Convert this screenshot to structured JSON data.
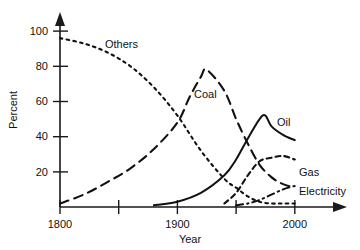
{
  "chart_data": {
    "type": "line",
    "title": "",
    "xlabel": "Year",
    "ylabel": "Percent",
    "xlim": [
      1800,
      2010
    ],
    "ylim": [
      0,
      105
    ],
    "grid": false,
    "legend_position": "inline-labels",
    "x_ticks": [
      {
        "value": 1800,
        "label": "1800"
      },
      {
        "value": 1850,
        "label": ""
      },
      {
        "value": 1900,
        "label": "1900"
      },
      {
        "value": 1950,
        "label": ""
      },
      {
        "value": 2000,
        "label": "2000"
      }
    ],
    "y_ticks": [
      {
        "value": 20,
        "label": "20"
      },
      {
        "value": 40,
        "label": "40"
      },
      {
        "value": 60,
        "label": "60"
      },
      {
        "value": 80,
        "label": "80"
      },
      {
        "value": 100,
        "label": "100"
      }
    ],
    "series": [
      {
        "name": "Others",
        "label": "Others",
        "style": "dotted",
        "x": [
          1800,
          1820,
          1840,
          1860,
          1880,
          1900,
          1920,
          1940,
          1950,
          1960,
          1970,
          1980,
          1990,
          2000
        ],
        "values": [
          96,
          93,
          88,
          80,
          68,
          52,
          32,
          16,
          11,
          6,
          3,
          2,
          2,
          2
        ]
      },
      {
        "name": "Coal",
        "label": "Coal",
        "style": "long-dash",
        "x": [
          1800,
          1820,
          1840,
          1860,
          1880,
          1900,
          1910,
          1920,
          1925,
          1940,
          1950,
          1960,
          1970,
          1980,
          1990,
          2000
        ],
        "values": [
          2,
          7,
          14,
          22,
          33,
          48,
          62,
          74,
          78,
          66,
          50,
          36,
          24,
          17,
          13,
          11
        ]
      },
      {
        "name": "Oil",
        "label": "Oil",
        "style": "solid",
        "x": [
          1880,
          1900,
          1920,
          1940,
          1950,
          1960,
          1970,
          1975,
          1980,
          1990,
          2000
        ],
        "values": [
          1,
          3,
          8,
          18,
          27,
          39,
          50,
          52,
          46,
          41,
          38
        ]
      },
      {
        "name": "Gas",
        "label": "Gas",
        "style": "short-dash",
        "x": [
          1940,
          1950,
          1960,
          1970,
          1980,
          1990,
          2000
        ],
        "values": [
          2,
          8,
          18,
          26,
          28,
          29,
          27
        ]
      },
      {
        "name": "Electricity",
        "label": "Electricity",
        "style": "dash-dot",
        "x": [
          1950,
          1960,
          1970,
          1980,
          1990,
          2000
        ],
        "values": [
          1,
          2,
          4,
          7,
          10,
          12
        ]
      }
    ],
    "annotations": [
      {
        "text": "Others",
        "x_px": 105,
        "y_px": 48
      },
      {
        "text": "Coal",
        "x_px": 194,
        "y_px": 98
      },
      {
        "text": "Oil",
        "x_px": 277,
        "y_px": 126
      },
      {
        "text": "Gas",
        "x_px": 299,
        "y_px": 176
      },
      {
        "text": "Electricity",
        "x_px": 299,
        "y_px": 195
      }
    ],
    "colors": {
      "line": "#111111",
      "axis": "#1a1a1a",
      "background": "#ffffff",
      "text": "#111111"
    }
  }
}
